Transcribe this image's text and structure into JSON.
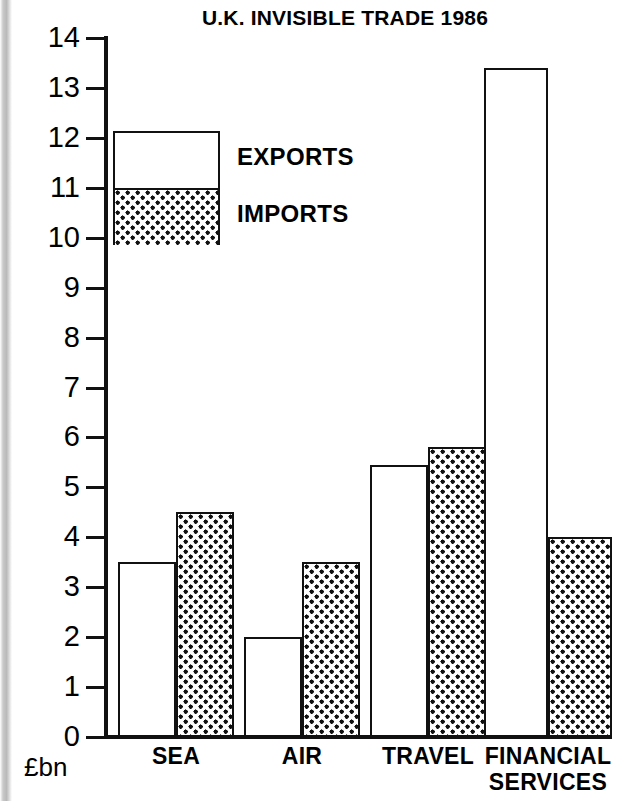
{
  "chart_data": {
    "type": "bar",
    "title": "U.K. INVISIBLE TRADE 1986",
    "xlabel": "",
    "ylabel": "£bn",
    "ylim": [
      0,
      14
    ],
    "yticks": [
      0,
      1,
      2,
      3,
      4,
      5,
      6,
      7,
      8,
      9,
      10,
      11,
      12,
      13,
      14
    ],
    "ytick_labels": [
      "0",
      "1",
      "2",
      "3",
      "4",
      "5",
      "6",
      "7",
      "8",
      "9",
      "10",
      "11",
      "12",
      "13",
      "14"
    ],
    "grid": false,
    "legend_position": "upper-left-inside",
    "categories": [
      "SEA",
      "AIR",
      "TRAVEL",
      "FINANCIAL SERVICES"
    ],
    "category_label_lines": [
      [
        "SEA"
      ],
      [
        "AIR"
      ],
      [
        "TRAVEL"
      ],
      [
        "FINANCIAL",
        "SERVICES"
      ]
    ],
    "series": [
      {
        "name": "EXPORTS",
        "fill": "white",
        "values": [
          3.5,
          2.0,
          5.45,
          13.4
        ]
      },
      {
        "name": "IMPORTS",
        "fill": "dotted",
        "values": [
          4.5,
          3.5,
          5.8,
          4.0
        ]
      }
    ]
  },
  "legend": {
    "exports_label": "EXPORTS",
    "imports_label": "IMPORTS"
  },
  "axis": {
    "unit_label": "£bn"
  },
  "colors": {
    "ink": "#111111",
    "paper": "#ffffff"
  }
}
